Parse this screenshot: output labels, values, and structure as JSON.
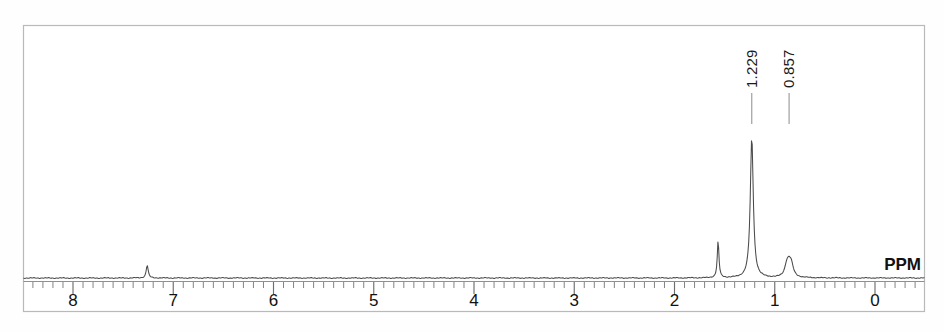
{
  "figure": {
    "kind": "nmr-spectrum",
    "unit_label": "PPM",
    "frame_color": "#b9b9b9",
    "trace_color": "#4a4a4a",
    "text_color": "#111111"
  },
  "peak_labels": [
    {
      "text": "1.229",
      "ppm": 1.229
    },
    {
      "text": "0.857",
      "ppm": 0.857
    }
  ],
  "axis_ticks": [
    {
      "label": "8",
      "ppm": 8
    },
    {
      "label": "7",
      "ppm": 7
    },
    {
      "label": "6",
      "ppm": 6
    },
    {
      "label": "5",
      "ppm": 5
    },
    {
      "label": "4",
      "ppm": 4
    },
    {
      "label": "3",
      "ppm": 3
    },
    {
      "label": "2",
      "ppm": 2
    },
    {
      "label": "1",
      "ppm": 1
    },
    {
      "label": "0",
      "ppm": 0
    }
  ],
  "chart_data": {
    "type": "line",
    "title": "",
    "xlabel": "PPM",
    "ylabel": "",
    "xlim": [
      8.45,
      -0.3
    ],
    "ylim": [
      0,
      1.0
    ],
    "grid": false,
    "legend": null,
    "x_axis_reversed": true,
    "categories": [
      "8",
      "7",
      "6",
      "5",
      "4",
      "3",
      "2",
      "1",
      "0"
    ],
    "annotations": [
      "1.229",
      "0.857"
    ],
    "series": [
      {
        "name": "1H NMR trace",
        "peaks": [
          {
            "ppm": 7.26,
            "height": 0.085,
            "width": 0.012,
            "labeled": false
          },
          {
            "ppm": 1.565,
            "height": 0.245,
            "width": 0.01,
            "labeled": false
          },
          {
            "ppm": 1.229,
            "height": 0.935,
            "width": 0.018,
            "labeled": true,
            "label": "1.229"
          },
          {
            "ppm": 0.857,
            "height": 0.095,
            "width": 0.03,
            "labeled": true,
            "label": "0.857"
          },
          {
            "ppm": 0.882,
            "height": 0.055,
            "width": 0.022,
            "labeled": false
          },
          {
            "ppm": 0.833,
            "height": 0.052,
            "width": 0.022,
            "labeled": false
          }
        ],
        "baseline": 0.0
      }
    ]
  }
}
